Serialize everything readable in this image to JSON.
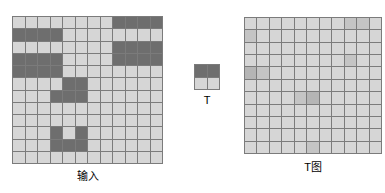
{
  "figure": {
    "colors": {
      "dark": "#6e6e6e",
      "light": "#d6d6d6",
      "mid_light": "#c4c4c4",
      "mid": "#b5b5b5",
      "grid_line": "#7b7b7b",
      "background": "#ffffff",
      "text": "#000000"
    },
    "panels": {
      "input": {
        "caption": "输入"
      },
      "template": {
        "caption": "T"
      },
      "result": {
        "caption": "T图"
      }
    }
  },
  "chart_data": {
    "type": "heatmap",
    "title": "",
    "xlabel": "",
    "ylabel": "",
    "grid": true,
    "legend_position": "none",
    "panels": [
      {
        "name": "input",
        "caption": "输入",
        "rows": 12,
        "cols": 12,
        "value_legend": {
          "0": "light",
          "1": "dark"
        },
        "values": [
          [
            0,
            0,
            0,
            0,
            0,
            0,
            0,
            0,
            1,
            1,
            1,
            1
          ],
          [
            1,
            1,
            1,
            1,
            0,
            0,
            0,
            0,
            0,
            0,
            0,
            0
          ],
          [
            0,
            0,
            0,
            0,
            0,
            0,
            0,
            0,
            1,
            1,
            1,
            1
          ],
          [
            1,
            1,
            1,
            1,
            0,
            0,
            0,
            0,
            1,
            1,
            1,
            1
          ],
          [
            1,
            1,
            1,
            1,
            0,
            0,
            0,
            0,
            0,
            0,
            0,
            0
          ],
          [
            0,
            0,
            0,
            0,
            1,
            1,
            0,
            0,
            0,
            0,
            0,
            0
          ],
          [
            0,
            0,
            0,
            1,
            1,
            1,
            0,
            0,
            0,
            0,
            0,
            0
          ],
          [
            0,
            0,
            0,
            0,
            0,
            0,
            0,
            0,
            0,
            0,
            0,
            0
          ],
          [
            0,
            0,
            0,
            0,
            0,
            0,
            0,
            0,
            0,
            0,
            0,
            0
          ],
          [
            0,
            0,
            0,
            1,
            0,
            1,
            0,
            0,
            0,
            0,
            0,
            0
          ],
          [
            0,
            0,
            0,
            1,
            1,
            1,
            0,
            0,
            0,
            0,
            0,
            0
          ],
          [
            0,
            0,
            0,
            0,
            0,
            0,
            0,
            0,
            0,
            0,
            0,
            0
          ]
        ]
      },
      {
        "name": "template",
        "caption": "T",
        "rows": 2,
        "cols": 2,
        "value_legend": {
          "0": "light",
          "1": "dark"
        },
        "values": [
          [
            1,
            1
          ],
          [
            0,
            0
          ]
        ]
      },
      {
        "name": "result",
        "caption": "T图",
        "rows": 11,
        "cols": 11,
        "value_legend": {
          "0": "light",
          "1": "mid-light",
          "2": "mid"
        },
        "values": [
          [
            0,
            0,
            0,
            0,
            0,
            0,
            0,
            0,
            1,
            1,
            0
          ],
          [
            1,
            0,
            0,
            0,
            0,
            0,
            0,
            0,
            0,
            0,
            0
          ],
          [
            0,
            0,
            0,
            0,
            0,
            0,
            0,
            0,
            0,
            0,
            0
          ],
          [
            0,
            0,
            0,
            0,
            0,
            0,
            0,
            0,
            1,
            0,
            0
          ],
          [
            2,
            1,
            0,
            0,
            0,
            0,
            0,
            0,
            0,
            0,
            0
          ],
          [
            0,
            0,
            0,
            0,
            0,
            0,
            0,
            0,
            0,
            0,
            0
          ],
          [
            0,
            0,
            0,
            0,
            1,
            2,
            0,
            0,
            0,
            0,
            0
          ],
          [
            0,
            0,
            0,
            0,
            0,
            0,
            0,
            0,
            0,
            0,
            0
          ],
          [
            0,
            0,
            0,
            0,
            0,
            0,
            0,
            0,
            0,
            0,
            0
          ],
          [
            0,
            0,
            0,
            0,
            0,
            0,
            0,
            0,
            0,
            0,
            0
          ],
          [
            0,
            0,
            0,
            0,
            0,
            1,
            0,
            0,
            0,
            0,
            0
          ]
        ]
      }
    ]
  }
}
